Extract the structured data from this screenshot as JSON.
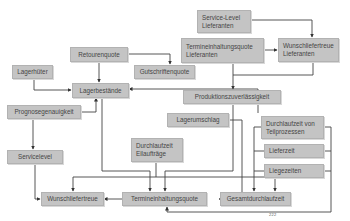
{
  "diagram": {
    "type": "kpi-dependency-diagram",
    "colors": {
      "box_fill": "#c4c4c4",
      "box_border": "#b2b2b2",
      "text": "#444444",
      "line": "#444444"
    },
    "nodes": {
      "service_level_lieferanten": {
        "line1": "Service-Level",
        "line2": "Lieferanten"
      },
      "termineinhaltungsquote_lieferanten": {
        "line1": "Termineinhaltungsquote",
        "line2": "Lieferanten"
      },
      "wunschliefertreue_lieferanten": {
        "line1": "Wunschliefertreue",
        "line2": "Lieferanten"
      },
      "retourenquote": {
        "label": "Retourenquote"
      },
      "gutschriftenquote": {
        "label": "Gutschriftenquote"
      },
      "lagerhueter": {
        "label": "Lagerhüter"
      },
      "lagerbestaende": {
        "label": "Lagerbestände"
      },
      "produktionszuverlaessigkeit": {
        "label": "Produktionszuverlässigkeit"
      },
      "prognosegenauigkeit": {
        "label": "Prognosegenauigkeit"
      },
      "lagerumschlag": {
        "label": "Lagerumschlag"
      },
      "durchlaufzeit_teilprozesse": {
        "line1": "Durchlaufzeit von",
        "line2": "Teilprozessen"
      },
      "durchlaufzeit_eilauftraege": {
        "line1": "Durchlaufzeit",
        "line2": "Eilaufträge"
      },
      "lieferzeit": {
        "label": "Lieferzeit"
      },
      "servicelevel": {
        "label": "Servicelevel"
      },
      "liegezeiten": {
        "label": "Liegezeiten"
      },
      "wunschliefertreue": {
        "label": "Wunschliefertreue"
      },
      "termineinhaltungsquote": {
        "label": "Termineinhaltungsquote"
      },
      "gesamtdurchlaufzeit": {
        "label": "Gesamtdurchlaufzeit"
      }
    },
    "edges": [
      {
        "from": "Service-Level Lieferanten",
        "to": "Wunschliefertreue Lieferanten"
      },
      {
        "from": "Termineinhaltungsquote Lieferanten",
        "to": "Wunschliefertreue Lieferanten"
      },
      {
        "from": "Termineinhaltungsquote Lieferanten",
        "to": "Produktionszuverlässigkeit"
      },
      {
        "from": "Wunschliefertreue Lieferanten",
        "to": "Produktionszuverlässigkeit"
      },
      {
        "from": "Retourenquote",
        "to": "Lagerbestände"
      },
      {
        "from": "Retourenquote",
        "to": "Gutschriftenquote"
      },
      {
        "from": "Lagerhüter",
        "to": "Lagerbestände"
      },
      {
        "from": "Prognosegenauigkeit",
        "to": "Lagerbestände"
      },
      {
        "from": "Prognosegenauigkeit",
        "to": "Servicelevel"
      },
      {
        "from": "Lagerumschlag",
        "to": "Lagerbestände"
      },
      {
        "from": "Servicelevel",
        "to": "Wunschliefertreue"
      },
      {
        "from": "Lagerbestände",
        "to": "Termineinhaltungsquote"
      },
      {
        "from": "Durchlaufzeit Eilaufträge",
        "to": "Wunschliefertreue"
      },
      {
        "from": "Durchlaufzeit Eilaufträge",
        "to": "Termineinhaltungsquote"
      },
      {
        "from": "Produktionszuverlässigkeit",
        "to": "Termineinhaltungsquote"
      },
      {
        "from": "Produktionszuverlässigkeit",
        "to": "Gesamtdurchlaufzeit"
      },
      {
        "from": "Lagerumschlag",
        "to": "Gesamtdurchlaufzeit"
      },
      {
        "from": "Termineinhaltungsquote",
        "to": "Wunschliefertreue"
      },
      {
        "from": "Durchlaufzeit von Teilprozessen",
        "to": "Gesamtdurchlaufzeit"
      },
      {
        "from": "Lieferzeit",
        "to": "Gesamtdurchlaufzeit"
      },
      {
        "from": "Liegezeiten",
        "to": "Gesamtdurchlaufzeit"
      },
      {
        "from": "Durchlaufzeit von Teilprozessen",
        "to": "Termineinhaltungsquote"
      }
    ],
    "footnote": "222"
  }
}
